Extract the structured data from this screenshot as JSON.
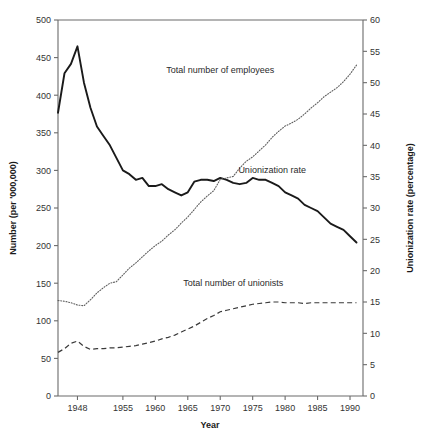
{
  "chart_data": {
    "type": "line",
    "title": "",
    "xlabel": "Year",
    "ylabel": "Number (per '000,000)",
    "y2label": "Unionization rate (percentage)",
    "xlim": [
      1945,
      1992
    ],
    "ylim": [
      0,
      500
    ],
    "y2lim": [
      0,
      60
    ],
    "grid": false,
    "legend_position": "inline-annotations",
    "xticks": [
      1948,
      1955,
      1960,
      1965,
      1970,
      1975,
      1980,
      1985,
      1990
    ],
    "xtick_labels": [
      "1948",
      "1955",
      "1960",
      "1965",
      "1970",
      "1975",
      "1980",
      "1985",
      "1990"
    ],
    "yticks": [
      0,
      50,
      100,
      150,
      200,
      250,
      300,
      350,
      400,
      450,
      500
    ],
    "ytick_labels": [
      "0",
      "50",
      "100",
      "150",
      "200",
      "250",
      "300",
      "350",
      "400",
      "450",
      "500"
    ],
    "y2ticks": [
      0,
      5,
      10,
      15,
      20,
      25,
      30,
      35,
      40,
      45,
      50,
      55,
      60
    ],
    "y2tick_labels": [
      "0",
      "5",
      "10",
      "15",
      "20",
      "25",
      "30",
      "35",
      "40",
      "45",
      "50",
      "55",
      "60"
    ],
    "x": [
      1945,
      1946,
      1947,
      1948,
      1949,
      1950,
      1951,
      1952,
      1953,
      1954,
      1955,
      1956,
      1957,
      1958,
      1959,
      1960,
      1961,
      1962,
      1963,
      1964,
      1965,
      1966,
      1967,
      1968,
      1969,
      1970,
      1971,
      1972,
      1973,
      1974,
      1975,
      1976,
      1977,
      1978,
      1979,
      1980,
      1981,
      1982,
      1983,
      1984,
      1985,
      1986,
      1987,
      1988,
      1989,
      1990,
      1991
    ],
    "series": [
      {
        "name": "Unionization rate",
        "axis": "right",
        "style": "solid",
        "color": "#1a1a1a",
        "units": "percentage",
        "values": [
          45.2,
          51.5,
          53.0,
          55.8,
          50.0,
          46.0,
          43.0,
          41.5,
          40.0,
          38.0,
          36.0,
          35.4,
          34.5,
          34.8,
          33.5,
          33.5,
          33.8,
          33.0,
          32.5,
          32.0,
          32.5,
          34.2,
          34.5,
          34.5,
          34.3,
          34.8,
          34.5,
          34.0,
          33.8,
          34.0,
          34.8,
          34.5,
          34.5,
          34.0,
          33.5,
          32.5,
          32.0,
          31.5,
          30.5,
          30.0,
          29.5,
          28.5,
          27.5,
          27.0,
          26.5,
          25.5,
          24.5
        ]
      },
      {
        "name": "Total number of employees",
        "axis": "left",
        "style": "dotted",
        "color": "#5f5f5f",
        "units": "per '000,000",
        "values": [
          127,
          126,
          124,
          121,
          120,
          128,
          137,
          144,
          150,
          152,
          161,
          170,
          177,
          185,
          193,
          200,
          206,
          214,
          221,
          230,
          238,
          248,
          258,
          266,
          273,
          288,
          290,
          292,
          303,
          312,
          318,
          326,
          334,
          344,
          352,
          359,
          363,
          368,
          375,
          383,
          390,
          398,
          404,
          410,
          418,
          428,
          440
        ]
      },
      {
        "name": "Total number of unionists",
        "axis": "left",
        "style": "dashed",
        "color": "#3a3a3a",
        "units": "per '000,000",
        "values": [
          58,
          63,
          70,
          73,
          66,
          62,
          63,
          63,
          64,
          64,
          65,
          66,
          67,
          69,
          71,
          73,
          76,
          78,
          81,
          85,
          89,
          93,
          98,
          103,
          107,
          112,
          114,
          116,
          118,
          120,
          122,
          123,
          124,
          125,
          125,
          124,
          124,
          124,
          123,
          124,
          124,
          124,
          124,
          124,
          124,
          124,
          124
        ]
      }
    ],
    "annotations": [
      {
        "text": "Total number of employees",
        "x": 1970,
        "y": 430,
        "axis": "left"
      },
      {
        "text": "Unionization rate",
        "x": 1978,
        "y": 296,
        "axis": "left"
      },
      {
        "text": "Total number of unionists",
        "x": 1972,
        "y": 146,
        "axis": "left"
      }
    ]
  }
}
